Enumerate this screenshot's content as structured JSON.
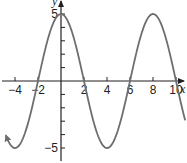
{
  "chart_data": {
    "type": "line",
    "title": "",
    "xlabel": "x",
    "ylabel": "y",
    "function": "y = 5cos(πx/4)",
    "xlim": [
      -5,
      11
    ],
    "ylim": [
      -6,
      6
    ],
    "grid": false,
    "x_ticks": [
      -4,
      -2,
      2,
      4,
      6,
      8,
      10
    ],
    "x_tick_labels": [
      "−4",
      "−2",
      "2",
      "4",
      "6",
      "8",
      "10"
    ],
    "y_ticks": [
      -5,
      -4,
      -3,
      -2,
      -1,
      1,
      2,
      3,
      4,
      5
    ],
    "y_tick_labels": [
      {
        "value": 5,
        "label": "5"
      },
      {
        "value": -5,
        "label": "−5"
      }
    ],
    "series": [
      {
        "name": "curve",
        "color": "#6d6e71",
        "x": [
          -4.8,
          -4,
          -3,
          -2,
          -1,
          0,
          1,
          2,
          3,
          4,
          5,
          6,
          7,
          8,
          9,
          10,
          10.8
        ],
        "y": [
          -4.62,
          -5,
          -3.54,
          0,
          3.54,
          5,
          3.54,
          0,
          -3.54,
          -5,
          -3.54,
          0,
          3.54,
          5,
          3.54,
          0,
          -3.3
        ]
      }
    ],
    "annotations": [
      "arrow at left end of curve"
    ]
  },
  "colors": {
    "axis": "#231f20",
    "curve": "#6d6e71"
  }
}
